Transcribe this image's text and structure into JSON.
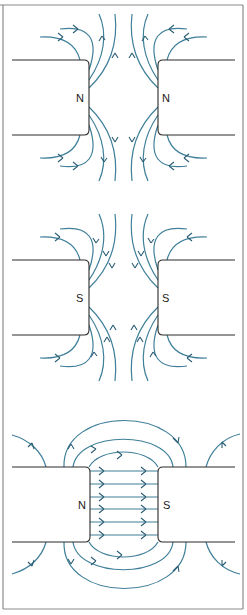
{
  "figure": {
    "colors": {
      "field_line": "#3f7f99",
      "arrow": "#2b5d73",
      "magnet_outline": "#2b2b2b",
      "frame": "#8a8a8a",
      "background": "#ffffff"
    },
    "panels": [
      {
        "id": "like-poles-north",
        "left_pole_label": "N",
        "right_pole_label": "N",
        "field_direction": "away from both poles (repulsion)"
      },
      {
        "id": "like-poles-south",
        "left_pole_label": "S",
        "right_pole_label": "S",
        "field_direction": "toward both poles (repulsion)"
      },
      {
        "id": "unlike-poles",
        "left_pole_label": "N",
        "right_pole_label": "S",
        "field_direction": "from N to S (attraction), uniform field in gap",
        "gap_line_count": 7
      }
    ]
  }
}
